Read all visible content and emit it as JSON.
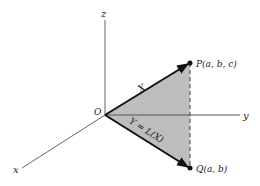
{
  "figure": {
    "axes": {
      "x_label": "x",
      "y_label": "y",
      "z_label": "z",
      "origin_label": "O"
    },
    "points": {
      "P_label": "P(a, b, c)",
      "Q_label": "Q(a, b)"
    },
    "vectors": {
      "X_label": "X",
      "Y_label": "Y = L(X)"
    },
    "colors": {
      "axis": "#666666",
      "vector": "#111111",
      "shade": "#b9b9b9",
      "text": "#222222"
    }
  }
}
